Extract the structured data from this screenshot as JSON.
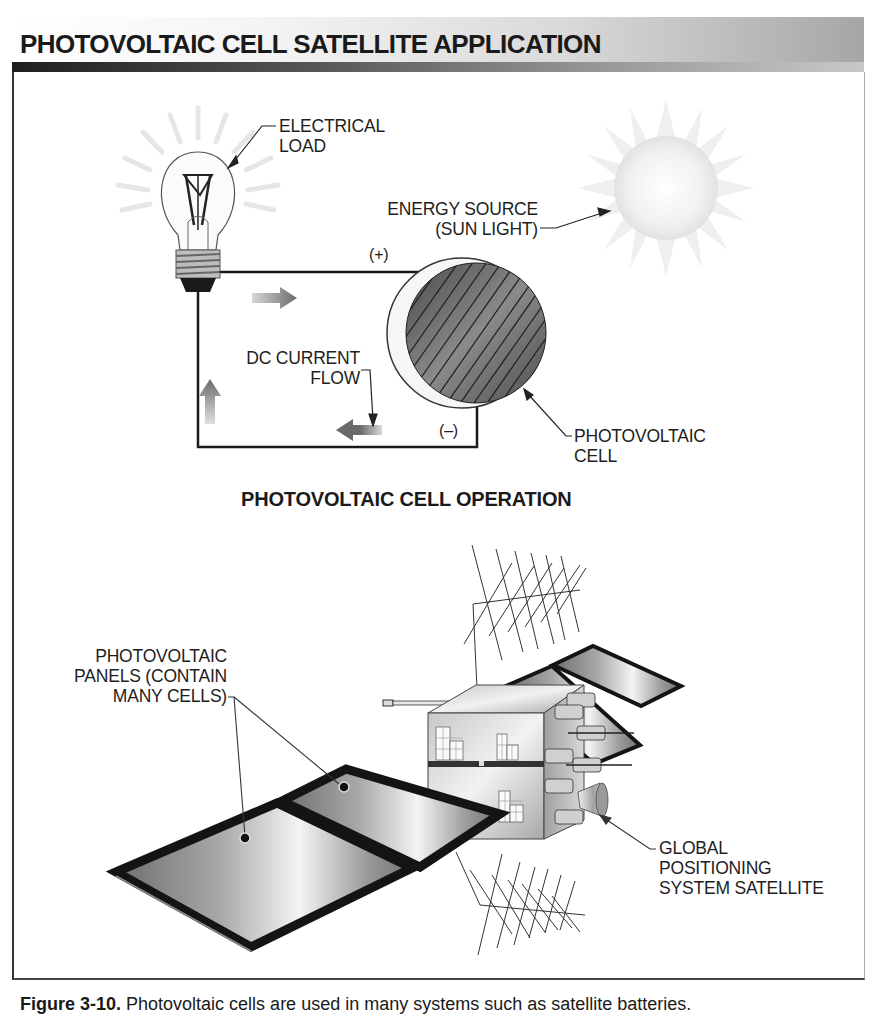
{
  "header": {
    "title": "PHOTOVOLTAIC CELL SATELLITE APPLICATION"
  },
  "operation_diagram": {
    "subtitle": "PHOTOVOLTAIC CELL OPERATION",
    "labels": {
      "electrical_load": [
        "ELECTRICAL",
        "LOAD"
      ],
      "energy_source": [
        "ENERGY SOURCE",
        "(SUN LIGHT)"
      ],
      "positive_terminal": "(+)",
      "negative_terminal": "(–)",
      "dc_current_flow": [
        "DC CURRENT",
        "FLOW"
      ],
      "photovoltaic_cell": [
        "PHOTOVOLTAIC",
        "CELL"
      ]
    }
  },
  "satellite_diagram": {
    "labels": {
      "photovoltaic_panels": [
        "PHOTOVOLTAIC",
        "PANELS (CONTAIN",
        "MANY CELLS)"
      ],
      "gps_satellite": [
        "GLOBAL",
        "POSITIONING",
        "SYSTEM SATELLITE"
      ]
    }
  },
  "caption": {
    "figure_number": "Figure 3-10.",
    "text": "Photovoltaic cells are used in many systems such as satellite batteries."
  },
  "colors": {
    "title_text": "#1a1a1a",
    "frame_border": "#333333",
    "band_light": "#f2f2f2",
    "band_dark": "#a8a8a8",
    "cell_fill": "#6e6e6e",
    "panel_frame": "#141414"
  }
}
